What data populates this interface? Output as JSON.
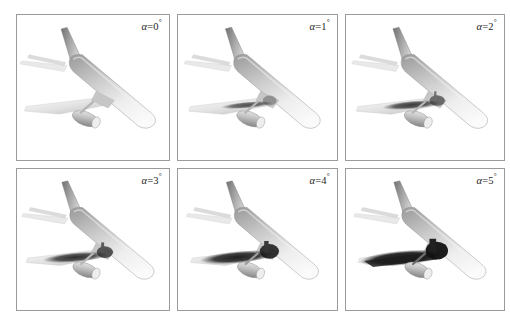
{
  "figure": {
    "type": "cfd-surface-flow-panel-grid",
    "rows": 2,
    "columns": 3,
    "background_color": "#ffffff",
    "panel_border_color": "#9a9a9a",
    "view": "front-right three-quarter from above"
  },
  "panels": [
    {
      "id": "panel-alpha-0",
      "label_symbol": "α",
      "label_equals": "=",
      "label_value": "0",
      "label_degree": "°",
      "label_full": "α=0°",
      "alpha_deg": 0,
      "separation_extent": 0.0,
      "separation_opacity": 0.0,
      "junction_opacity": 0.0,
      "row": 1,
      "column": 1
    },
    {
      "id": "panel-alpha-1",
      "label_symbol": "α",
      "label_equals": "=",
      "label_value": "1",
      "label_degree": "°",
      "label_full": "α=1°",
      "alpha_deg": 1,
      "separation_extent": 0.34,
      "separation_opacity": 0.68,
      "junction_opacity": 0.3,
      "row": 1,
      "column": 2
    },
    {
      "id": "panel-alpha-2",
      "label_symbol": "α",
      "label_equals": "=",
      "label_value": "2",
      "label_degree": "°",
      "label_full": "α=2°",
      "alpha_deg": 2,
      "separation_extent": 0.5,
      "separation_opacity": 0.78,
      "junction_opacity": 0.52,
      "row": 1,
      "column": 3
    },
    {
      "id": "panel-alpha-3",
      "label_symbol": "α",
      "label_equals": "=",
      "label_value": "3",
      "label_degree": "°",
      "label_full": "α=3°",
      "alpha_deg": 3,
      "separation_extent": 0.66,
      "separation_opacity": 0.84,
      "junction_opacity": 0.66,
      "row": 2,
      "column": 1
    },
    {
      "id": "panel-alpha-4",
      "label_symbol": "α",
      "label_equals": "=",
      "label_value": "4",
      "label_degree": "°",
      "label_full": "α=4°",
      "alpha_deg": 4,
      "separation_extent": 0.84,
      "separation_opacity": 0.9,
      "junction_opacity": 0.84,
      "row": 2,
      "column": 2
    },
    {
      "id": "panel-alpha-5",
      "label_symbol": "α",
      "label_equals": "=",
      "label_value": "5",
      "label_degree": "°",
      "label_full": "α=5°",
      "alpha_deg": 5,
      "separation_extent": 1.0,
      "separation_opacity": 0.94,
      "junction_opacity": 0.95,
      "row": 2,
      "column": 3
    }
  ],
  "colors": {
    "surface_light": "#f2f2f2",
    "surface_mid": "#b9b9b9",
    "surface_dark": "#8d8d8d",
    "fin_shadow": "#6f6f6f",
    "separation_dark": "#141414",
    "border": "#9a9a9a",
    "label_text": "#1d1d1d",
    "background": "#ffffff"
  }
}
